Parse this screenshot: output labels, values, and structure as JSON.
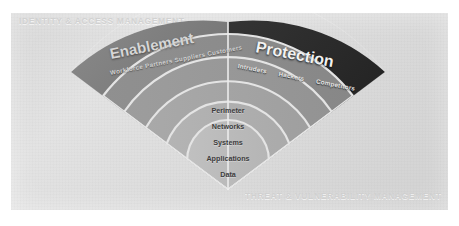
{
  "slide": {
    "ghost_top_label": "IDENTITY & ACCESS MANAGEMENT",
    "ghost_bottom_label": "THREAT & VULNERABILITY MANAGEMENT"
  },
  "diagram": {
    "type": "fan-wedge-layered",
    "left_half": {
      "title": "Enablement",
      "subtitle": "Workforce Partners Suppliers Customers",
      "fill": "#7a7a7a"
    },
    "right_half": {
      "title": "Protection",
      "actors": [
        "Intruders",
        "Hackers",
        "Competitors"
      ],
      "fill": "#2b2b2b"
    },
    "layers": [
      {
        "label": "Perimeter",
        "fill": "#8e8e8e"
      },
      {
        "label": "Networks",
        "fill": "#9a9a9a"
      },
      {
        "label": "Systems",
        "fill": "#a6a6a6"
      },
      {
        "label": "Applications",
        "fill": "#b0b0b0"
      },
      {
        "label": "Data",
        "fill": "#bcbcbc"
      }
    ],
    "colors": {
      "panel_background": "#dcdcdc",
      "ghost_text": "#cfcfcf",
      "layer_text": "#3d3d3d",
      "divider": "#e6e6e6"
    }
  }
}
